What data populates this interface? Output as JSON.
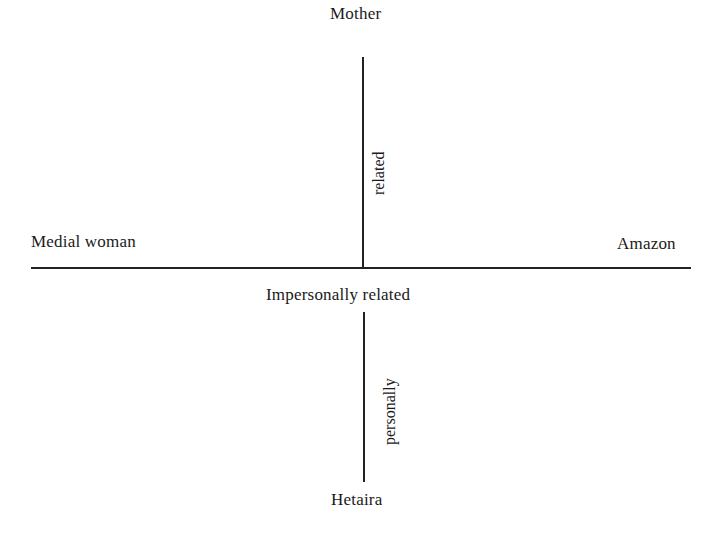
{
  "diagram": {
    "title": "",
    "poles": {
      "top": "Mother",
      "bottom": "Hetaira",
      "left": "Medial woman",
      "right": "Amazon"
    },
    "axis_labels": {
      "center": "Impersonally related",
      "upper_vertical": "related",
      "lower_vertical": "personally"
    },
    "colors": {
      "ink": "#222222",
      "background": "#ffffff"
    }
  }
}
